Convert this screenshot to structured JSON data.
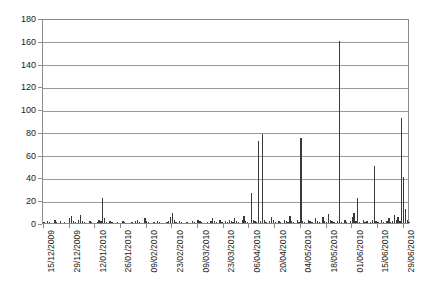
{
  "chart_data": {
    "type": "bar",
    "title": "",
    "subtitle": "",
    "xlabel": "",
    "ylabel": "",
    "ylim": [
      0,
      180
    ],
    "ytick_step": 20,
    "ytick_labels": [
      "0",
      "20",
      "40",
      "60",
      "80",
      "100",
      "120",
      "140",
      "160",
      "180"
    ],
    "grid": true,
    "legend": false,
    "legend_position": "none",
    "bar_color": "#3a3a3a",
    "axis_color": "#8c8c8c",
    "gridline_color": "#9a9a9a",
    "background_color": "#ffffff",
    "xtick_labels": [
      "15/12/2009",
      "29/12/2009",
      "12/01/2010",
      "26/01/2010",
      "09/02/2010",
      "23/02/2010",
      "09/03/2010",
      "23/03/2010",
      "06/04/2010",
      "20/04/2010",
      "04/05/2010",
      "18/05/2010",
      "01/06/2010",
      "15/06/2010",
      "29/06/2010"
    ],
    "xtick_interval_days": 14,
    "x_start_date": "15/12/2009",
    "x_end_date": "29/06/2010",
    "n_points": 200,
    "values": [
      1,
      0,
      2,
      1,
      0,
      0,
      3,
      1,
      0,
      2,
      0,
      1,
      0,
      0,
      4,
      6,
      2,
      1,
      0,
      3,
      7,
      2,
      1,
      0,
      0,
      2,
      1,
      0,
      0,
      1,
      3,
      2,
      22,
      4,
      1,
      0,
      2,
      1,
      0,
      0,
      1,
      0,
      0,
      2,
      1,
      0,
      0,
      0,
      1,
      0,
      2,
      3,
      1,
      0,
      0,
      4,
      2,
      1,
      0,
      0,
      1,
      0,
      2,
      1,
      0,
      0,
      0,
      1,
      2,
      5,
      9,
      3,
      1,
      0,
      2,
      1,
      0,
      0,
      1,
      0,
      0,
      2,
      1,
      0,
      3,
      2,
      1,
      0,
      0,
      1,
      0,
      2,
      4,
      2,
      1,
      0,
      3,
      1,
      0,
      2,
      1,
      3,
      2,
      1,
      4,
      2,
      1,
      0,
      3,
      6,
      2,
      1,
      0,
      26,
      3,
      2,
      1,
      72,
      2,
      78,
      3,
      1,
      0,
      2,
      5,
      3,
      1,
      0,
      2,
      1,
      0,
      3,
      2,
      1,
      6,
      2,
      1,
      0,
      3,
      1,
      75,
      2,
      1,
      0,
      3,
      2,
      1,
      0,
      4,
      2,
      1,
      0,
      5,
      2,
      1,
      8,
      3,
      2,
      1,
      0,
      2,
      160,
      1,
      0,
      3,
      1,
      0,
      2,
      5,
      9,
      2,
      22,
      1,
      0,
      3,
      1,
      2,
      0,
      1,
      3,
      50,
      2,
      1,
      0,
      3,
      1,
      0,
      2,
      4,
      1,
      2,
      7,
      3,
      5,
      2,
      92,
      40,
      12,
      3,
      1
    ],
    "notable_peaks": [
      {
        "value": 160,
        "approx_date": "04/05/2010"
      },
      {
        "value": 92,
        "approx_date": "27/06/2010"
      },
      {
        "value": 78,
        "approx_date": "27/03/2010"
      },
      {
        "value": 75,
        "approx_date": "14/04/2010"
      },
      {
        "value": 72,
        "approx_date": "25/03/2010"
      },
      {
        "value": 50,
        "approx_date": "02/06/2010"
      },
      {
        "value": 40,
        "approx_date": "28/06/2010"
      },
      {
        "value": 26,
        "approx_date": "21/03/2010"
      },
      {
        "value": 22,
        "approx_date": "17/01/2010"
      },
      {
        "value": 22,
        "approx_date": "16/05/2010"
      }
    ]
  }
}
